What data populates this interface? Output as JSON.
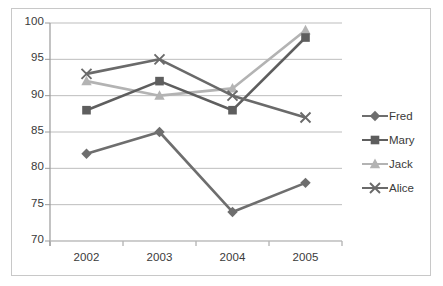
{
  "chart_data": {
    "type": "line",
    "title": "",
    "subtitle": "",
    "xlabel": "",
    "ylabel": "",
    "categories": [
      "2002",
      "2003",
      "2004",
      "2005"
    ],
    "x": [
      2002,
      2003,
      2004,
      2005
    ],
    "ylim": [
      70,
      100
    ],
    "y_ticks": [
      70,
      75,
      80,
      85,
      90,
      95,
      100
    ],
    "y_tick_labels": [
      "70",
      "75",
      "80",
      "85",
      "90",
      "95",
      "100"
    ],
    "x_tick_labels": [
      "2002",
      "2003",
      "2004",
      "2005"
    ],
    "grid": "horizontal",
    "legend_position": "right",
    "series": [
      {
        "name": "Fred",
        "values": [
          82,
          85,
          74,
          78
        ],
        "color": "#6e6e6e",
        "marker": "diamond"
      },
      {
        "name": "Mary",
        "values": [
          88,
          92,
          88,
          98
        ],
        "color": "#5e5e5e",
        "marker": "square"
      },
      {
        "name": "Jack",
        "values": [
          92,
          90,
          91,
          99
        ],
        "color": "#b3b3b3",
        "marker": "triangle"
      },
      {
        "name": "Alice",
        "values": [
          93,
          95,
          90,
          87
        ],
        "color": "#6a6a6a",
        "marker": "x"
      }
    ]
  },
  "legend": {
    "items": [
      {
        "label": "Fred"
      },
      {
        "label": "Mary"
      },
      {
        "label": "Jack"
      },
      {
        "label": "Alice"
      }
    ]
  },
  "axes": {
    "y_labels": [
      "100",
      "95",
      "90",
      "85",
      "80",
      "75",
      "70"
    ],
    "x_labels": [
      "2002",
      "2003",
      "2004",
      "2005"
    ]
  },
  "colors": {
    "frame_border": "#c8c8c8",
    "gridline": "#bdbdbd",
    "axis_line": "#9a9a9a",
    "text": "#3a3a3a",
    "background": "#ffffff"
  }
}
